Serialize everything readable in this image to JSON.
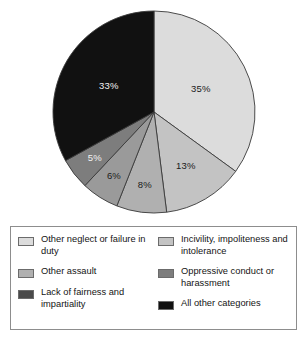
{
  "chart_data": {
    "type": "pie",
    "title": "",
    "subtitle": "",
    "xlabel": "",
    "ylabel": "",
    "grid": false,
    "legend_position": "bottom",
    "start_angle_deg": 0,
    "direction": "clockwise",
    "labels_format": "percent",
    "categories": [
      "Other neglect or failure in duty",
      "Incivility, impoliteness and intolerance",
      "Other assault",
      "Oppressive conduct or harassment",
      "Lack of fairness and impartiality",
      "All other categories"
    ],
    "values": [
      35,
      13,
      8,
      6,
      5,
      33
    ],
    "data_labels": [
      "35%",
      "13%",
      "8%",
      "6%",
      "5%",
      "33%"
    ],
    "colors": [
      "#dcdcdc",
      "#c3c3c3",
      "#b0b0b0",
      "#9a9a9a",
      "#7d7d7d",
      "#111111"
    ],
    "slices": [
      {
        "label": "Other neglect or failure in duty",
        "value": 35,
        "data_label": "35%",
        "color": "#dcdcdc",
        "label_color": "#1a1a1a"
      },
      {
        "label": "Incivility, impoliteness and intolerance",
        "value": 13,
        "data_label": "13%",
        "color": "#c3c3c3",
        "label_color": "#1a1a1a"
      },
      {
        "label": "Other assault",
        "value": 8,
        "data_label": "8%",
        "color": "#b0b0b0",
        "label_color": "#1a1a1a"
      },
      {
        "label": "Oppressive conduct or harassment",
        "value": 6,
        "data_label": "6%",
        "color": "#9a9a9a",
        "label_color": "#1a1a1a"
      },
      {
        "label": "Lack of fairness and impartiality",
        "value": 5,
        "data_label": "5%",
        "color": "#7d7d7d",
        "label_color": "#f2f2f2"
      },
      {
        "label": "All other categories",
        "value": 33,
        "data_label": "33%",
        "color": "#111111",
        "label_color": "#f2f2f2"
      }
    ]
  },
  "legend": {
    "left_column": [
      {
        "label": "Other neglect or failure in duty",
        "color": "#dcdcdc"
      },
      {
        "label": "Other assault",
        "color": "#b0b0b0"
      },
      {
        "label": "Lack of fairness and impartiality",
        "color": "#4a4a4a"
      }
    ],
    "right_column": [
      {
        "label": "Incivility, impoliteness and intolerance",
        "color": "#c3c3c3"
      },
      {
        "label": "Oppressive conduct or harassment",
        "color": "#7d7d7d"
      },
      {
        "label": "All other categories",
        "color": "#111111"
      }
    ]
  }
}
